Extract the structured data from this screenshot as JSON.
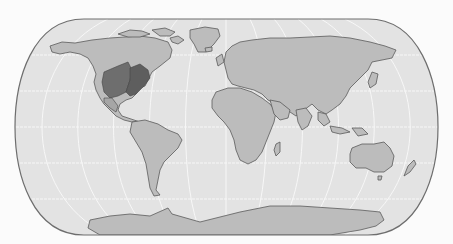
{
  "map": {
    "projection": "eckert-iv-like",
    "description": "World map with graticule; highlighted region in central and eastern United States",
    "colors": {
      "background": "#fbfbfb",
      "ocean": "#e3e3e3",
      "land": "#b9b9b9",
      "land_light": "#cfcfcf",
      "highlight_dark": "#6b6b6b",
      "highlight_mid": "#8a8a8a",
      "coast": "#5a5a5a",
      "graticule": "#f6f6f6",
      "frame": "#6e6e6e"
    },
    "highlighted_regions": [
      "Central United States",
      "Eastern United States"
    ]
  }
}
